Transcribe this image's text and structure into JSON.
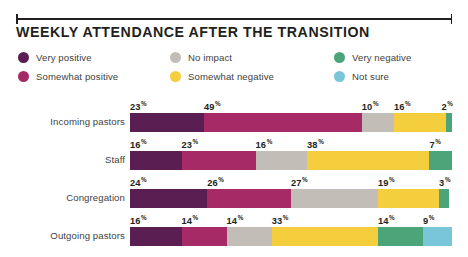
{
  "header": {
    "title": "WEEKLY ATTENDANCE AFTER THE TRANSITION"
  },
  "legend": [
    {
      "label": "Very positive",
      "color": "#5b1e52",
      "name": "very-positive"
    },
    {
      "label": "No impact",
      "color": "#c3bdb8",
      "name": "no-impact"
    },
    {
      "label": "Very negative",
      "color": "#4ba578",
      "name": "very-negative"
    },
    {
      "label": "Somewhat positive",
      "color": "#a62a65",
      "name": "somewhat-positive"
    },
    {
      "label": "Somewhat negative",
      "color": "#f4ce3c",
      "name": "somewhat-negative"
    },
    {
      "label": "Not sure",
      "color": "#79c6d9",
      "name": "not-sure"
    }
  ],
  "chart_data": {
    "type": "bar",
    "orientation": "horizontal",
    "stacked": true,
    "normalized_percent": true,
    "title": "WEEKLY ATTENDANCE AFTER THE TRANSITION",
    "xlabel": "",
    "ylabel": "",
    "xlim": [
      0,
      100
    ],
    "grid": false,
    "legend_position": "top",
    "value_label_suffix": "%",
    "categories": [
      "Incoming pastors",
      "Staff",
      "Congregation",
      "Outgoing pastors"
    ],
    "series": [
      {
        "name": "Very positive",
        "color": "#5b1e52",
        "values": [
          23,
          16,
          24,
          16
        ]
      },
      {
        "name": "Somewhat positive",
        "color": "#a62a65",
        "values": [
          49,
          23,
          26,
          14
        ]
      },
      {
        "name": "No impact",
        "color": "#c3bdb8",
        "values": [
          10,
          16,
          27,
          14
        ]
      },
      {
        "name": "Somewhat negative",
        "color": "#f4ce3c",
        "values": [
          16,
          38,
          19,
          33
        ]
      },
      {
        "name": "Very negative",
        "color": "#4ba578",
        "values": [
          2,
          7,
          3,
          14
        ]
      },
      {
        "name": "Not sure",
        "color": "#79c6d9",
        "values": [
          0,
          0,
          0,
          9
        ]
      }
    ],
    "rows": [
      {
        "category": "Incoming pastors",
        "segments": [
          {
            "series": "Very positive",
            "value": 23,
            "label": "23",
            "color": "#5b1e52"
          },
          {
            "series": "Somewhat positive",
            "value": 49,
            "label": "49",
            "color": "#a62a65"
          },
          {
            "series": "No impact",
            "value": 10,
            "label": "10",
            "color": "#c3bdb8"
          },
          {
            "series": "Somewhat negative",
            "value": 16,
            "label": "16",
            "color": "#f4ce3c"
          },
          {
            "series": "Very negative",
            "value": 2,
            "label": "2",
            "color": "#4ba578"
          }
        ]
      },
      {
        "category": "Staff",
        "segments": [
          {
            "series": "Very positive",
            "value": 16,
            "label": "16",
            "color": "#5b1e52"
          },
          {
            "series": "Somewhat positive",
            "value": 23,
            "label": "23",
            "color": "#a62a65"
          },
          {
            "series": "No impact",
            "value": 16,
            "label": "16",
            "color": "#c3bdb8"
          },
          {
            "series": "Somewhat negative",
            "value": 38,
            "label": "38",
            "color": "#f4ce3c"
          },
          {
            "series": "Very negative",
            "value": 7,
            "label": "7",
            "color": "#4ba578"
          }
        ]
      },
      {
        "category": "Congregation",
        "segments": [
          {
            "series": "Very positive",
            "value": 24,
            "label": "24",
            "color": "#5b1e52"
          },
          {
            "series": "Somewhat positive",
            "value": 26,
            "label": "26",
            "color": "#a62a65"
          },
          {
            "series": "No impact",
            "value": 27,
            "label": "27",
            "color": "#c3bdb8"
          },
          {
            "series": "Somewhat negative",
            "value": 19,
            "label": "19",
            "color": "#f4ce3c"
          },
          {
            "series": "Very negative",
            "value": 3,
            "label": "3",
            "color": "#4ba578"
          }
        ]
      },
      {
        "category": "Outgoing pastors",
        "segments": [
          {
            "series": "Very positive",
            "value": 16,
            "label": "16",
            "color": "#5b1e52"
          },
          {
            "series": "Somewhat positive",
            "value": 14,
            "label": "14",
            "color": "#a62a65"
          },
          {
            "series": "No impact",
            "value": 14,
            "label": "14",
            "color": "#c3bdb8"
          },
          {
            "series": "Somewhat negative",
            "value": 33,
            "label": "33",
            "color": "#f4ce3c"
          },
          {
            "series": "Very negative",
            "value": 14,
            "label": "14",
            "color": "#4ba578"
          },
          {
            "series": "Not sure",
            "value": 9,
            "label": "9",
            "color": "#79c6d9"
          }
        ]
      }
    ]
  }
}
